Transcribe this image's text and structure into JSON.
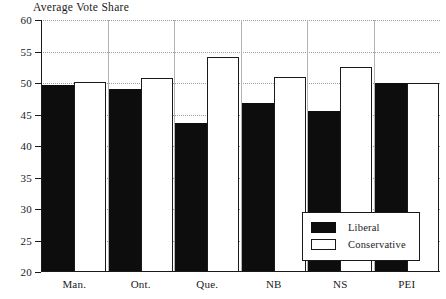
{
  "chart_data": {
    "type": "bar",
    "title": "Average Vote Share",
    "xlabel": "",
    "ylabel": "",
    "ylim": [
      20,
      60
    ],
    "yticks": [
      20,
      25,
      30,
      35,
      40,
      45,
      50,
      55,
      60
    ],
    "ytick_labels": [
      "20",
      "25",
      "30",
      "35",
      "40",
      "45",
      "50",
      "55",
      "60"
    ],
    "grid": true,
    "grid_style": "dotted",
    "legend_position": "bottom-right",
    "categories": [
      "Man.",
      "Ont.",
      "Que.",
      "NB",
      "NS",
      "PEI"
    ],
    "series": [
      {
        "name": "Liberal",
        "color": "#0d0d0d",
        "fill": "solid",
        "values": [
          49.7,
          49.0,
          43.6,
          46.9,
          45.5,
          50.0
        ]
      },
      {
        "name": "Conservative",
        "color": "#ffffff",
        "fill": "open",
        "values": [
          50.1,
          50.8,
          54.2,
          50.9,
          52.5,
          50.0
        ]
      }
    ]
  },
  "legend": {
    "items": [
      {
        "label": "Liberal"
      },
      {
        "label": "Conservative"
      }
    ]
  },
  "colors": {
    "liberal": "#0d0d0d",
    "conservative": "#ffffff",
    "axis": "#1a1a1a",
    "grid": "#9a9a9a",
    "separator": "#b4b4b4",
    "background": "#ffffff"
  }
}
